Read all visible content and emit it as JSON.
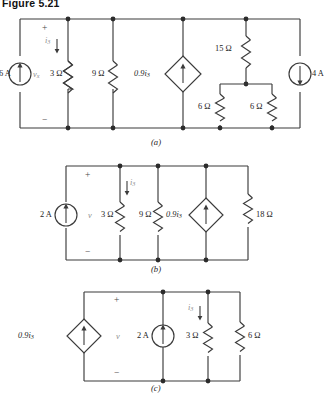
{
  "figure": {
    "title": "Figure 5.21"
  },
  "panels": [
    {
      "id": "a",
      "caption": "(a)",
      "plus": "+",
      "minus": "−",
      "voltage_label": "v",
      "voltage_sub": "x",
      "current_label": "i",
      "current_sub": "3",
      "sources": [
        {
          "name": "independent-current-source-6a",
          "label": "6 A",
          "direction": "up",
          "type": "independent"
        },
        {
          "name": "dependent-current-source",
          "label": "0.9i",
          "sub": "3",
          "direction": "up",
          "type": "dependent"
        },
        {
          "name": "independent-current-source-4a",
          "label": "4 A",
          "direction": "down",
          "type": "independent"
        }
      ],
      "resistors": [
        {
          "name": "resistor-3ohm",
          "label": "3 Ω"
        },
        {
          "name": "resistor-9ohm",
          "label": "9 Ω"
        },
        {
          "name": "resistor-15ohm",
          "label": "15 Ω"
        },
        {
          "name": "resistor-6ohm-left",
          "label": "6 Ω"
        },
        {
          "name": "resistor-6ohm-right",
          "label": "6 Ω"
        }
      ]
    },
    {
      "id": "b",
      "caption": "(b)",
      "plus": "+",
      "minus": "−",
      "voltage_label": "v",
      "voltage_sub": "",
      "current_label": "i",
      "current_sub": "3",
      "sources": [
        {
          "name": "independent-current-source-2a",
          "label": "2 A",
          "direction": "up",
          "type": "independent"
        },
        {
          "name": "dependent-current-source",
          "label": "0.9i",
          "sub": "3",
          "direction": "up",
          "type": "dependent"
        }
      ],
      "resistors": [
        {
          "name": "resistor-3ohm",
          "label": "3 Ω"
        },
        {
          "name": "resistor-9ohm",
          "label": "9 Ω"
        },
        {
          "name": "resistor-18ohm",
          "label": "18 Ω"
        }
      ]
    },
    {
      "id": "c",
      "caption": "(c)",
      "plus": "+",
      "minus": "−",
      "voltage_label": "v",
      "voltage_sub": "",
      "current_label": "i",
      "current_sub": "3",
      "sources": [
        {
          "name": "dependent-current-source",
          "label": "0.9i",
          "sub": "3",
          "direction": "up",
          "type": "dependent"
        },
        {
          "name": "independent-current-source-2a",
          "label": "2 A",
          "direction": "up",
          "type": "independent"
        }
      ],
      "resistors": [
        {
          "name": "resistor-3ohm",
          "label": "3 Ω"
        },
        {
          "name": "resistor-6ohm",
          "label": "6 Ω"
        }
      ]
    }
  ]
}
